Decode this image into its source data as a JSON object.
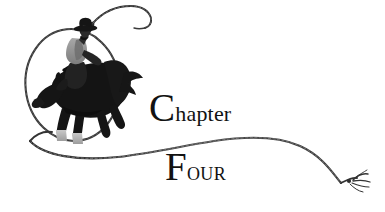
{
  "page": {
    "title": "Chapter Four",
    "background_color": "#ffffff",
    "width": 385,
    "height": 212,
    "kind": "book-chapter-heading-illustration"
  },
  "heading": {
    "line1": {
      "full_text": "Chapter",
      "initial": "C",
      "remainder": "hapter",
      "style": "serif-drop-cap-lowercase"
    },
    "line2": {
      "full_text": "Four",
      "initial": "F",
      "remainder": "our",
      "style": "serif-drop-cap-small-caps"
    },
    "color": "#121212"
  },
  "illustration": {
    "description": "Bucking bronco with cowboy rider inside a lasso loop, rope trailing to the right and ending in a frayed tip",
    "elements": [
      {
        "name": "lasso-loop",
        "shape": "ellipse",
        "color": "#3a3a3a"
      },
      {
        "name": "bronco-horse",
        "shape": "silhouette",
        "color": "#141414"
      },
      {
        "name": "cowboy-rider",
        "shape": "silhouette",
        "color": "#2a2a2a"
      },
      {
        "name": "rider-shirt",
        "shape": "fill",
        "color": "#9a9a9a"
      },
      {
        "name": "horse-hoof",
        "shape": "fill",
        "color": "#b4b4b4"
      },
      {
        "name": "swung-rope-overhead",
        "shape": "stroke",
        "color": "#2e2e2e"
      },
      {
        "name": "rope-tail",
        "shape": "stroke",
        "color": "#3a3a3a"
      },
      {
        "name": "rope-frayed-end",
        "shape": "strands",
        "color": "#333333"
      }
    ],
    "ink_color": "#141414",
    "midtone_color": "#8d8d8d",
    "highlight_color": "#bdbdbd"
  }
}
